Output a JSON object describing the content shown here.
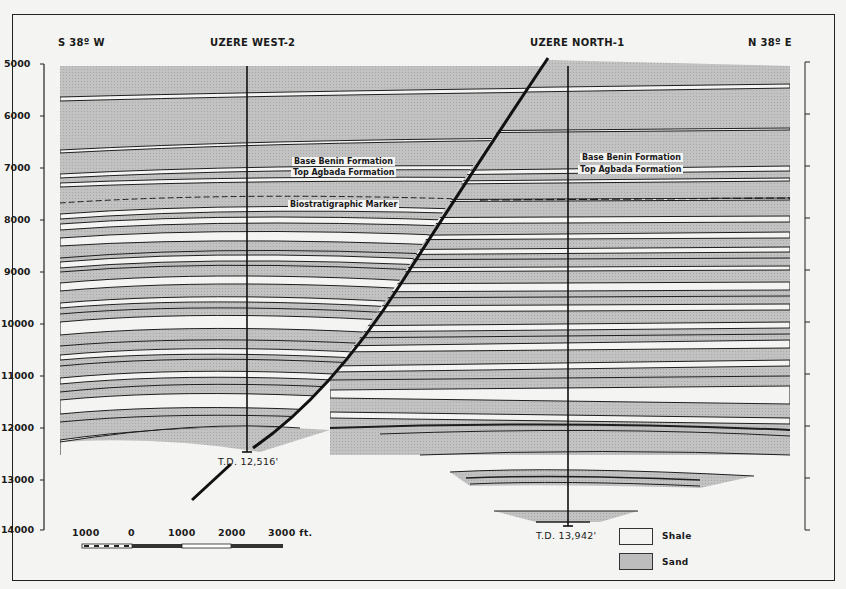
{
  "header": {
    "left_bearing": "S 38º W",
    "right_bearing": "N 38º E",
    "well_west": "UZERE WEST-2",
    "well_north": "UZERE NORTH-1"
  },
  "depth_axis": {
    "unit": "ft",
    "ticks": [
      "5000",
      "6000",
      "7000",
      "8000",
      "9000",
      "10000",
      "11000",
      "12000",
      "13000",
      "14000"
    ]
  },
  "annotations": {
    "west_base_benin": "Base Benin Formation",
    "west_top_agbada": "Top Agbada Formation",
    "west_biostrat": "Biostratigraphic Marker",
    "north_base_benin": "Base Benin Formation",
    "north_top_agbada": "Top Agbada Formation",
    "td_west": "T.D. 12,516'",
    "td_north": "T.D. 13,942'"
  },
  "scale_bar": {
    "labels": [
      "1000",
      "0",
      "1000",
      "2000",
      "3000 ft."
    ]
  },
  "legend": {
    "items": [
      {
        "label": "Shale",
        "color": "#f4f4f2"
      },
      {
        "label": "Sand",
        "color": "#bdbdbd"
      }
    ]
  },
  "colors": {
    "sand": "#bdbdbd",
    "shale": "#f4f4f2",
    "line": "#1e1e1e"
  }
}
